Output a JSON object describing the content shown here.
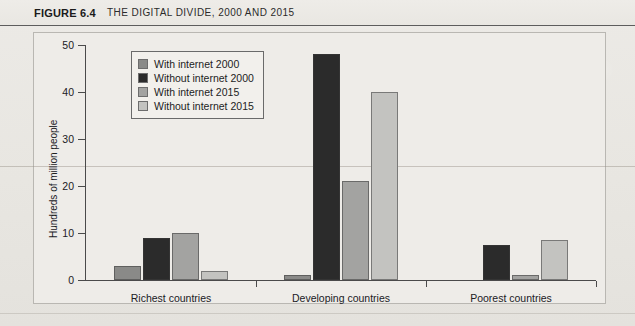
{
  "figure": {
    "label": "FIGURE 6.4",
    "title": "THE DIGITAL DIVIDE, 2000 AND 2015"
  },
  "colors": {
    "with_internet_2000": "#8a8a88",
    "without_internet_2000": "#2b2b2b",
    "with_internet_2015": "#a3a3a1",
    "without_internet_2015": "#c3c3c0",
    "axis": "#4a4a4a",
    "panel_background": "#eeece8",
    "page_background": "#e9e8e4"
  },
  "chart_data": {
    "type": "bar",
    "title": "THE DIGITAL DIVIDE, 2000 AND 2015",
    "xlabel": "",
    "ylabel": "Hundreds of million people",
    "categories": [
      "Richest countries",
      "Developing countries",
      "Poorest countries"
    ],
    "yticks": [
      0,
      10,
      20,
      30,
      40,
      50
    ],
    "ytick_labels": [
      "0",
      "10",
      "20",
      "30",
      "40",
      "50"
    ],
    "ylim": [
      0,
      50
    ],
    "grid": false,
    "legend_position": "upper left",
    "series": [
      {
        "name": "With internet 2000",
        "color": "#8a8a88",
        "values": [
          3,
          1,
          0
        ]
      },
      {
        "name": "Without internet 2000",
        "color": "#2b2b2b",
        "values": [
          9,
          48,
          7.5
        ]
      },
      {
        "name": "With internet 2015",
        "color": "#a3a3a1",
        "values": [
          10,
          21,
          1
        ]
      },
      {
        "name": "Without internet 2015",
        "color": "#c3c3c0",
        "values": [
          2,
          40,
          8.5
        ]
      }
    ]
  }
}
